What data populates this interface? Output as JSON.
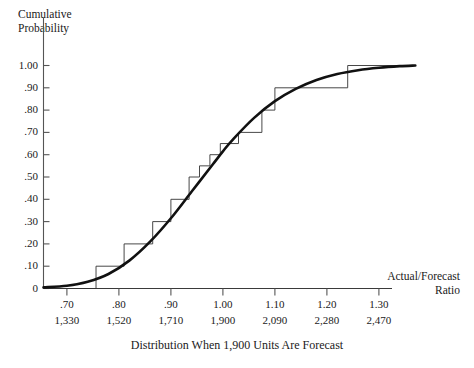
{
  "chart_data": {
    "type": "line",
    "title": "",
    "caption": "Distribution When 1,900 Units Are Forecast",
    "ylabel": "Cumulative\nProbability",
    "xlabel": "Actual/Forecast\nRatio",
    "xlim": [
      0.655,
      1.37
    ],
    "ylim": [
      0,
      1.0
    ],
    "grid": false,
    "legend": "none",
    "yticks": [
      "0",
      ".10",
      ".20",
      ".30",
      ".40",
      ".50",
      ".60",
      ".70",
      ".80",
      ".90",
      "1.00"
    ],
    "ytick_values": [
      0,
      0.1,
      0.2,
      0.3,
      0.4,
      0.5,
      0.6,
      0.7,
      0.8,
      0.9,
      1.0
    ],
    "xticks": [
      ".70",
      ".80",
      ".90",
      "1.00",
      "1.10",
      "1.20",
      "1.30"
    ],
    "xtick_values": [
      0.7,
      0.8,
      0.9,
      1.0,
      1.1,
      1.2,
      1.3
    ],
    "xticks_secondary": [
      "1,330",
      "1,520",
      "1,710",
      "1,900",
      "2,090",
      "2,280",
      "2,470"
    ],
    "series": [
      {
        "name": "smooth-ogive",
        "style": "thick-smooth-curve",
        "x": [
          0.655,
          0.7,
          0.74,
          0.78,
          0.82,
          0.86,
          0.9,
          0.94,
          0.98,
          1.0,
          1.02,
          1.06,
          1.1,
          1.14,
          1.18,
          1.22,
          1.26,
          1.3,
          1.34,
          1.37
        ],
        "y": [
          0.005,
          0.012,
          0.03,
          0.065,
          0.125,
          0.21,
          0.315,
          0.435,
          0.555,
          0.615,
          0.67,
          0.765,
          0.84,
          0.895,
          0.935,
          0.962,
          0.979,
          0.99,
          0.997,
          1.0
        ]
      },
      {
        "name": "empirical-step-function",
        "style": "thin-step",
        "step_x": [
          0.655,
          0.756,
          0.81,
          0.865,
          0.9,
          0.935,
          0.955,
          0.975,
          0.995,
          1.03,
          1.075,
          1.1,
          1.24,
          1.37
        ],
        "step_y": [
          0.0,
          0.1,
          0.2,
          0.3,
          0.4,
          0.5,
          0.55,
          0.6,
          0.65,
          0.7,
          0.8,
          0.9,
          1.0,
          1.0
        ]
      }
    ]
  }
}
